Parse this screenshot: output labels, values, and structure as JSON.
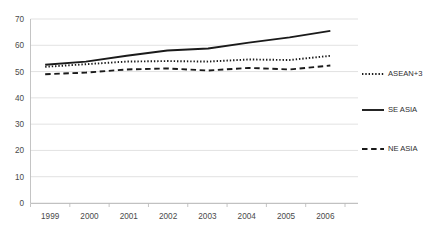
{
  "chart_data": {
    "type": "line",
    "title": "",
    "subtitle": "",
    "xlabel": "",
    "ylabel": "",
    "categories": [
      "1999",
      "2000",
      "2001",
      "2002",
      "2003",
      "2004",
      "2005",
      "2006"
    ],
    "x": [
      1999,
      2000,
      2001,
      2002,
      2003,
      2004,
      2005,
      2006
    ],
    "ylim": [
      0,
      70
    ],
    "y_ticks": [
      0,
      10,
      20,
      30,
      40,
      50,
      60,
      70
    ],
    "y_tick_labels": [
      "0",
      "10",
      "20",
      "30",
      "40",
      "50",
      "60",
      "70"
    ],
    "x_tick_labels": [
      "1999",
      "2000",
      "2001",
      "2002",
      "2003",
      "2004",
      "2005",
      "2006"
    ],
    "grid": "horizontal",
    "legend_position": "right",
    "series": [
      {
        "name": "ASEAN+3",
        "style": "dotted",
        "color": "#1a1a1a",
        "values": [
          51.8,
          52.8,
          53.8,
          54.0,
          53.8,
          54.6,
          54.4,
          56.0
        ]
      },
      {
        "name": "SE ASIA",
        "style": "solid",
        "color": "#1a1a1a",
        "values": [
          52.6,
          53.8,
          56.0,
          58.0,
          58.8,
          61.0,
          63.0,
          65.5
        ]
      },
      {
        "name": "NE ASIA",
        "style": "dashed",
        "color": "#1a1a1a",
        "values": [
          49.0,
          49.6,
          50.8,
          51.2,
          50.4,
          51.4,
          50.8,
          52.3
        ]
      }
    ]
  },
  "legend": {
    "items": [
      {
        "label": "ASEAN+3",
        "style": "dotted"
      },
      {
        "label": "SE ASIA",
        "style": "solid"
      },
      {
        "label": "NE ASIA",
        "style": "dashed"
      }
    ]
  },
  "colors": {
    "background": "#ffffff",
    "gridline": "#d4d4d4",
    "axis": "#b5b5b5",
    "series": "#1a1a1a",
    "tick_text": "#4a4a4a",
    "legend_text": "#2e2e2e"
  }
}
